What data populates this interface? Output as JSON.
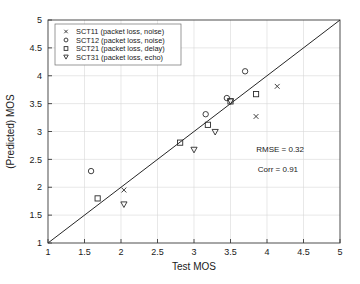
{
  "chart_data": {
    "type": "scatter",
    "title": "",
    "xlabel": "Test MOS",
    "ylabel": "(Predicted) MOS",
    "xlim": [
      1,
      5
    ],
    "ylim": [
      1,
      5
    ],
    "xticks": [
      "1",
      "1.5",
      "2",
      "2.5",
      "3",
      "3.5",
      "4",
      "4.5",
      "5"
    ],
    "yticks": [
      "1",
      "1.5",
      "2",
      "2.5",
      "3",
      "3.5",
      "4",
      "4.5",
      "5"
    ],
    "xtick_values": [
      1,
      1.5,
      2,
      2.5,
      3,
      3.5,
      4,
      4.5,
      5
    ],
    "ytick_values": [
      1,
      1.5,
      2,
      2.5,
      3,
      3.5,
      4,
      4.5,
      5
    ],
    "grid": true,
    "legend_position": "upper-left",
    "reference_line": {
      "name": "identity-line",
      "from": [
        1,
        1
      ],
      "to": [
        5,
        5
      ]
    },
    "series": [
      {
        "name": "SCT11 (packet loss, noise)",
        "marker": "x",
        "points": [
          [
            2.04,
            1.95
          ],
          [
            3.85,
            3.27
          ],
          [
            4.14,
            3.81
          ]
        ]
      },
      {
        "name": "SCT12 (packet loss, noise)",
        "marker": "circle",
        "points": [
          [
            1.59,
            2.29
          ],
          [
            3.16,
            3.31
          ],
          [
            3.45,
            3.6
          ],
          [
            3.7,
            4.08
          ]
        ]
      },
      {
        "name": "SCT21 (packet loss, delay)",
        "marker": "square",
        "points": [
          [
            1.68,
            1.8
          ],
          [
            2.81,
            2.8
          ],
          [
            3.19,
            3.12
          ],
          [
            3.5,
            3.54
          ],
          [
            3.85,
            3.67
          ]
        ]
      },
      {
        "name": "SCT31 (packet loss, echo)",
        "marker": "triangle-down",
        "points": [
          [
            2.04,
            1.69
          ],
          [
            3.0,
            2.67
          ],
          [
            3.29,
            2.99
          ],
          [
            3.5,
            3.54
          ]
        ]
      }
    ],
    "annotations": [
      {
        "name": "rmse",
        "text": "RMSE = 0.32",
        "x": 4.18,
        "y": 2.63
      },
      {
        "name": "corr",
        "text": "Corr = 0.91",
        "x": 4.15,
        "y": 2.28
      }
    ]
  },
  "legend": {
    "entries": [
      {
        "label": "SCT11 (packet loss, noise)"
      },
      {
        "label": "SCT12 (packet loss, noise)"
      },
      {
        "label": "SCT21 (packet loss, delay)"
      },
      {
        "label": "SCT31 (packet loss, echo)"
      }
    ]
  },
  "colors": {
    "axis": "#3a3a3a",
    "grid": "#d8d8d8",
    "marker": "#2b2b2b",
    "reference_line": "#262626",
    "background": "#ffffff"
  }
}
